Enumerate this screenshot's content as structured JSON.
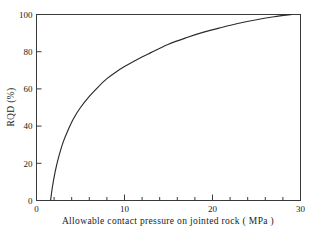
{
  "figure": {
    "background_color": "#ffffff",
    "frame_color": "#3a3a3a",
    "curve_color": "#2b2b2b"
  },
  "chart_data": {
    "type": "line",
    "title": "",
    "subtitle": "",
    "xlabel": "Allowable contact pressure on jointed rock ( MPa )",
    "ylabel": "RQD (%)",
    "xlim": [
      0,
      30
    ],
    "ylim": [
      0,
      100
    ],
    "grid": false,
    "legend": null,
    "legend_position": "none",
    "x_major_ticks": [
      0,
      10,
      20,
      30
    ],
    "x_major_tick_labels": [
      "0",
      "10",
      "20",
      "30"
    ],
    "x_minor_ticks": [
      2,
      4,
      6,
      8,
      12,
      14,
      16,
      18,
      22,
      24,
      26,
      28
    ],
    "y_major_ticks": [
      0,
      20,
      40,
      60,
      80,
      100
    ],
    "y_major_tick_labels": [
      "0",
      "20",
      "40",
      "60",
      "80",
      "100"
    ],
    "y_minor_ticks": [],
    "series": [
      {
        "name": "RQD vs allowable contact pressure",
        "x": [
          1.6,
          1.8,
          2.1,
          2.5,
          3.0,
          3.6,
          4.2,
          5.0,
          6.0,
          7.0,
          8.0,
          9.0,
          10.0,
          11.5,
          13.0,
          15.0,
          17.0,
          19.0,
          21.0,
          23.0,
          25.0,
          27.0,
          29.0
        ],
        "y": [
          0,
          7,
          15,
          23,
          31,
          38,
          44,
          50,
          56,
          61,
          65.5,
          69,
          72,
          76,
          79.5,
          84,
          87.5,
          90.5,
          93,
          95.3,
          97.2,
          98.8,
          100
        ]
      }
    ],
    "annotations": []
  }
}
